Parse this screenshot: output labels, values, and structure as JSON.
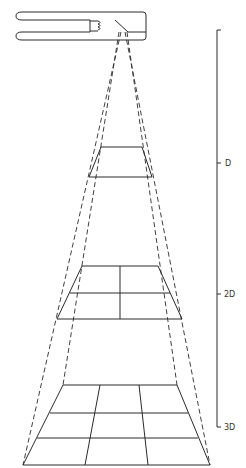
{
  "figure": {
    "source": {
      "name": "lamp-housing"
    },
    "scale": {
      "labels": [
        "D",
        "2D",
        "3D"
      ]
    },
    "planes": [
      {
        "name": "plane-at-D",
        "grid": [
          1,
          1
        ]
      },
      {
        "name": "plane-at-2D",
        "grid": [
          2,
          2
        ]
      },
      {
        "name": "plane-at-3D",
        "grid": [
          3,
          3
        ]
      }
    ]
  }
}
